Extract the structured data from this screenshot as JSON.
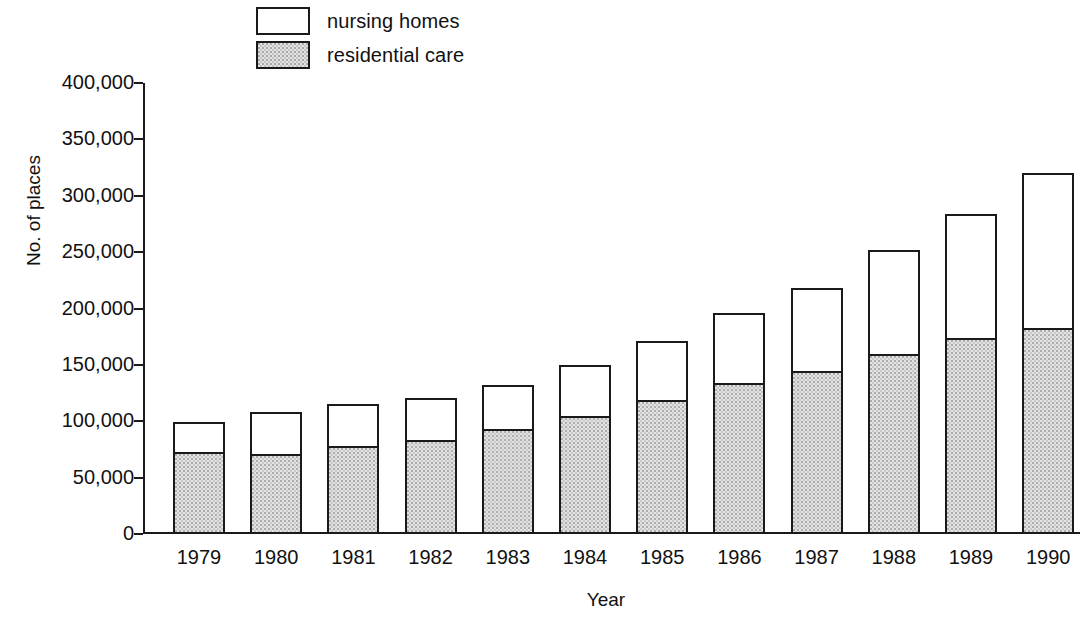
{
  "chart_data": {
    "type": "bar",
    "title": "",
    "subtitle": "",
    "xlabel": "Year",
    "ylabel": "No. of places",
    "categories": [
      "1979",
      "1980",
      "1981",
      "1982",
      "1983",
      "1984",
      "1985",
      "1986",
      "1987",
      "1988",
      "1989",
      "1990"
    ],
    "stacked": true,
    "series": [
      {
        "name": "residential care",
        "color": "#e3e3e3",
        "values": [
          73000,
          71000,
          78000,
          83000,
          93000,
          105000,
          119000,
          134000,
          145000,
          160000,
          174000,
          183000
        ]
      },
      {
        "name": "nursing homes",
        "color": "#ffffff",
        "values": [
          26000,
          37000,
          37000,
          38000,
          39000,
          45000,
          52000,
          62000,
          73000,
          92000,
          110000,
          137000
        ]
      }
    ],
    "totals": [
      99000,
      108000,
      115000,
      121000,
      132000,
      150000,
      171000,
      196000,
      218000,
      252000,
      284000,
      320000
    ],
    "ylim": [
      0,
      400000
    ],
    "ytick_values": [
      0,
      50000,
      100000,
      150000,
      200000,
      250000,
      300000,
      350000,
      400000
    ],
    "ytick_labels": [
      "0",
      "50,000",
      "100,000",
      "150,000",
      "200,000",
      "250,000",
      "300,000",
      "350,000",
      "400,000"
    ],
    "grid": false,
    "legend_position": "top-left",
    "legend_entries": [
      {
        "label": "nursing homes",
        "swatch": "white-box"
      },
      {
        "label": "residential care",
        "swatch": "gray-stipple-box"
      }
    ]
  },
  "axis": {
    "y_title": "No. of places",
    "x_title": "Year"
  },
  "legend": {
    "items": [
      {
        "label": "nursing homes"
      },
      {
        "label": "residential care"
      }
    ]
  }
}
